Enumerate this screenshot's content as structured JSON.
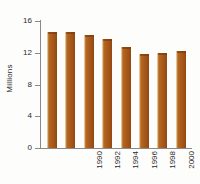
{
  "chart_data": {
    "type": "bar",
    "title": "",
    "subtitle": "",
    "xlabel": "",
    "ylabel": "Millions",
    "categories": [
      "1990",
      "1992",
      "1994",
      "1996",
      "1998",
      "2000",
      "2002",
      "2004"
    ],
    "values": [
      14.6,
      14.6,
      14.2,
      13.7,
      12.7,
      11.8,
      12.0,
      12.2
    ],
    "series": [
      {
        "name": "Millions",
        "values": [
          14.6,
          14.6,
          14.2,
          13.7,
          12.7,
          11.8,
          12.0,
          12.2
        ]
      }
    ],
    "ylim": [
      0,
      16
    ],
    "yticks": [
      0,
      4,
      8,
      12,
      16
    ],
    "ytick_labels": [
      "0",
      "4",
      "8",
      "12",
      "16"
    ],
    "xtick_labels": [
      "1990",
      "1992",
      "1994",
      "1996",
      "1998",
      "2000",
      "2002",
      "2004"
    ],
    "xtick_rotation": 90,
    "ylabel_rotation": 90,
    "grid": false,
    "legend": null,
    "legend_position": "none",
    "bar_color": "#A8581A",
    "axis_color": "#8A8A8A",
    "text_color": "#2B2B2B",
    "background_color": "#FDFDFB"
  },
  "axes": {
    "y_title": "Millions",
    "y_ticks": [
      {
        "label": "16",
        "value": 16
      },
      {
        "label": "12",
        "value": 12
      },
      {
        "label": "8",
        "value": 8
      },
      {
        "label": "4",
        "value": 4
      },
      {
        "label": "0",
        "value": 0
      }
    ],
    "x_ticks": [
      {
        "label": "1990"
      },
      {
        "label": "1992"
      },
      {
        "label": "1994"
      },
      {
        "label": "1996"
      },
      {
        "label": "1998"
      },
      {
        "label": "2000"
      },
      {
        "label": "2002"
      },
      {
        "label": "2004"
      }
    ]
  }
}
